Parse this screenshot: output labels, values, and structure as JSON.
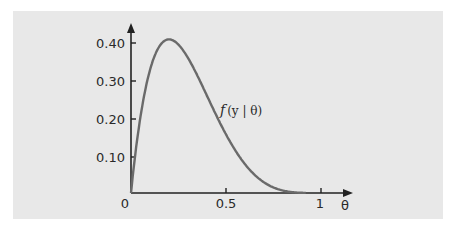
{
  "chart_data": {
    "type": "line",
    "title": "",
    "xlabel": "θ",
    "ylabel": "",
    "xlim": [
      0,
      1.1
    ],
    "ylim": [
      0,
      0.45
    ],
    "x_ticks": [
      0,
      0.5,
      1
    ],
    "x_tick_labels": [
      "0",
      "0.5",
      "1"
    ],
    "y_ticks": [
      0.1,
      0.2,
      0.3,
      0.4
    ],
    "y_tick_labels": [
      "0.10",
      "0.20",
      "0.30",
      "0.40"
    ],
    "grid": false,
    "series": [
      {
        "name": "f(y | θ)",
        "x": [
          0,
          0.05,
          0.1,
          0.15,
          0.2,
          0.25,
          0.3,
          0.35,
          0.4,
          0.45,
          0.5,
          0.55,
          0.6,
          0.65,
          0.7,
          0.75,
          0.8,
          0.85,
          0.9
        ],
        "values": [
          0,
          0.204,
          0.328,
          0.392,
          0.41,
          0.396,
          0.36,
          0.312,
          0.259,
          0.206,
          0.156,
          0.113,
          0.077,
          0.049,
          0.028,
          0.015,
          0.006,
          0.002,
          0.0
        ]
      }
    ],
    "annotations": [
      {
        "text": "f(y | θ)",
        "x": 0.47,
        "y": 0.22
      }
    ]
  },
  "labels": {
    "origin": "0",
    "x_tick_05": "0.5",
    "x_tick_1": "1",
    "x_axis": "θ",
    "y_040": "0.40",
    "y_030": "0.30",
    "y_020": "0.20",
    "y_010": "0.10",
    "curve_f": "f",
    "curve_args": "(y | θ)"
  }
}
